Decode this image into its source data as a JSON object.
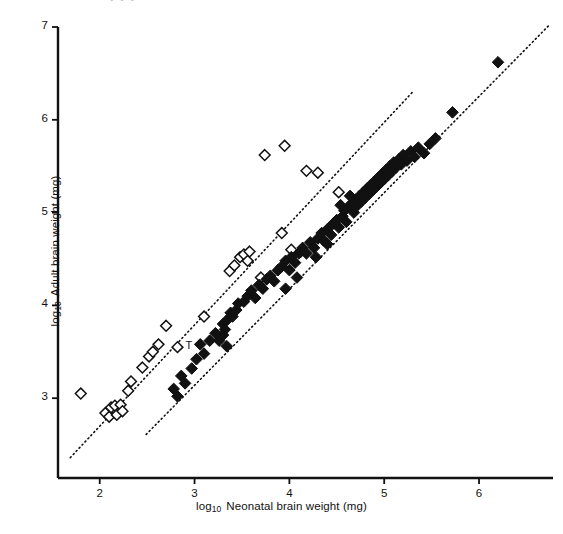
{
  "figure": {
    "background_color": "#ffffff",
    "ink_color": "#111111",
    "partial_top_text": "•   •              •"
  },
  "axes": {
    "x": {
      "title_prefix": "log",
      "title_sub": "10",
      "title_text": "Neonatal brain weight (mg)",
      "ticks": [
        2,
        3,
        4,
        5,
        6
      ],
      "tick_labels": [
        "2",
        "3",
        "4",
        "5",
        "6"
      ],
      "range": [
        1.56,
        6.78
      ],
      "pixel_left": 58,
      "pixel_right": 553,
      "pixel_axis_y": 478
    },
    "y": {
      "title_prefix": "log",
      "title_sub": "10",
      "title_text": "Adult brain weight (mg)",
      "ticks": [
        3,
        4,
        5,
        6,
        7
      ],
      "tick_labels": [
        "3",
        "4",
        "5",
        "6",
        "7"
      ],
      "range": [
        2.14,
        7.0
      ],
      "pixel_top": 27,
      "pixel_bottom": 478,
      "pixel_axis_x": 58
    }
  },
  "annotations": [
    {
      "name": "point-label-T",
      "text": "T",
      "x": 2.82,
      "y": 3.55
    }
  ],
  "chart_data": {
    "type": "scatter",
    "title": "",
    "xlabel": "log10 Neonatal brain weight (mg)",
    "ylabel": "log10 Adult brain weight (mg)",
    "xlim": [
      1.56,
      6.78
    ],
    "ylim": [
      2.14,
      7.0
    ],
    "grid": false,
    "legend": "none",
    "series": [
      {
        "name": "Open diamonds (haplorhines / upper group)",
        "marker": "open-diamond",
        "marker_fill": "#ffffff",
        "marker_stroke": "#111111",
        "points": [
          [
            1.8,
            3.05
          ],
          [
            2.06,
            2.84
          ],
          [
            2.1,
            2.8
          ],
          [
            2.12,
            2.9
          ],
          [
            2.16,
            2.92
          ],
          [
            2.18,
            2.82
          ],
          [
            2.22,
            2.93
          ],
          [
            2.24,
            2.86
          ],
          [
            2.3,
            3.08
          ],
          [
            2.33,
            3.18
          ],
          [
            2.45,
            3.33
          ],
          [
            2.52,
            3.45
          ],
          [
            2.56,
            3.5
          ],
          [
            2.62,
            3.58
          ],
          [
            2.7,
            3.78
          ],
          [
            2.82,
            3.55
          ],
          [
            3.1,
            3.88
          ],
          [
            3.37,
            4.37
          ],
          [
            3.42,
            4.43
          ],
          [
            3.48,
            4.52
          ],
          [
            3.52,
            4.55
          ],
          [
            3.56,
            4.48
          ],
          [
            3.58,
            4.58
          ],
          [
            3.7,
            4.3
          ],
          [
            3.74,
            5.62
          ],
          [
            3.92,
            4.78
          ],
          [
            3.95,
            5.72
          ],
          [
            4.02,
            4.6
          ],
          [
            4.12,
            4.58
          ],
          [
            4.18,
            5.45
          ],
          [
            4.3,
            5.43
          ],
          [
            4.52,
            5.22
          ]
        ]
      },
      {
        "name": "Filled diamonds (strepsirhines / lower group)",
        "marker": "filled-diamond",
        "marker_fill": "#111111",
        "marker_stroke": "#111111",
        "points": [
          [
            2.78,
            3.1
          ],
          [
            2.82,
            3.02
          ],
          [
            2.9,
            3.16
          ],
          [
            2.97,
            3.32
          ],
          [
            3.02,
            3.42
          ],
          [
            3.06,
            3.58
          ],
          [
            3.1,
            3.48
          ],
          [
            3.16,
            3.62
          ],
          [
            3.22,
            3.7
          ],
          [
            3.26,
            3.62
          ],
          [
            3.3,
            3.8
          ],
          [
            3.32,
            3.74
          ],
          [
            3.36,
            3.86
          ],
          [
            3.38,
            3.92
          ],
          [
            3.4,
            3.88
          ],
          [
            3.44,
            3.95
          ],
          [
            3.46,
            4.02
          ],
          [
            3.52,
            4.04
          ],
          [
            3.56,
            4.1
          ],
          [
            3.6,
            4.16
          ],
          [
            3.64,
            4.08
          ],
          [
            3.68,
            4.22
          ],
          [
            3.72,
            4.18
          ],
          [
            3.76,
            4.28
          ],
          [
            3.8,
            4.32
          ],
          [
            3.84,
            4.26
          ],
          [
            3.88,
            4.38
          ],
          [
            3.92,
            4.42
          ],
          [
            3.96,
            4.48
          ],
          [
            4.0,
            4.38
          ],
          [
            4.02,
            4.52
          ],
          [
            4.06,
            4.46
          ],
          [
            4.1,
            4.56
          ],
          [
            4.14,
            4.62
          ],
          [
            4.18,
            4.56
          ],
          [
            4.22,
            4.68
          ],
          [
            4.26,
            4.62
          ],
          [
            4.3,
            4.72
          ],
          [
            4.34,
            4.78
          ],
          [
            4.36,
            4.7
          ],
          [
            4.4,
            4.82
          ],
          [
            4.44,
            4.76
          ],
          [
            4.46,
            4.88
          ],
          [
            4.5,
            4.92
          ],
          [
            4.52,
            4.84
          ],
          [
            4.56,
            4.96
          ],
          [
            4.58,
            5.02
          ],
          [
            4.6,
            4.9
          ],
          [
            4.62,
            5.06
          ],
          [
            4.66,
            5.1
          ],
          [
            4.68,
            5.0
          ],
          [
            4.7,
            5.14
          ],
          [
            4.72,
            5.08
          ],
          [
            4.74,
            5.18
          ],
          [
            4.76,
            5.12
          ],
          [
            4.78,
            5.22
          ],
          [
            4.8,
            5.16
          ],
          [
            4.82,
            5.26
          ],
          [
            4.84,
            5.2
          ],
          [
            4.86,
            5.3
          ],
          [
            4.88,
            5.24
          ],
          [
            4.9,
            5.34
          ],
          [
            4.92,
            5.28
          ],
          [
            4.94,
            5.38
          ],
          [
            4.96,
            5.32
          ],
          [
            4.98,
            5.42
          ],
          [
            5.0,
            5.36
          ],
          [
            5.02,
            5.46
          ],
          [
            5.04,
            5.4
          ],
          [
            5.06,
            5.5
          ],
          [
            5.08,
            5.44
          ],
          [
            5.1,
            5.54
          ],
          [
            5.12,
            5.48
          ],
          [
            5.16,
            5.58
          ],
          [
            5.18,
            5.52
          ],
          [
            5.2,
            5.62
          ],
          [
            5.24,
            5.56
          ],
          [
            5.28,
            5.66
          ],
          [
            5.32,
            5.6
          ],
          [
            5.36,
            5.7
          ],
          [
            5.42,
            5.64
          ],
          [
            5.48,
            5.74
          ],
          [
            5.54,
            5.8
          ],
          [
            5.72,
            6.08
          ],
          [
            6.2,
            6.62
          ],
          [
            3.96,
            4.18
          ],
          [
            4.08,
            4.3
          ],
          [
            4.4,
            4.66
          ],
          [
            4.54,
            5.08
          ],
          [
            4.64,
            5.18
          ],
          [
            4.28,
            4.52
          ],
          [
            3.3,
            3.68
          ],
          [
            3.34,
            3.56
          ],
          [
            2.86,
            3.24
          ]
        ]
      }
    ],
    "trend_lines": [
      {
        "name": "upper-regression-line",
        "style": "dotted",
        "color": "#111111",
        "x_start": 1.69,
        "y_start": 2.36,
        "x_end": 5.3,
        "y_end": 6.3
      },
      {
        "name": "lower-regression-line",
        "style": "dotted",
        "color": "#111111",
        "x_start": 2.49,
        "y_start": 2.61,
        "x_end": 6.74,
        "y_end": 7.02
      }
    ]
  }
}
